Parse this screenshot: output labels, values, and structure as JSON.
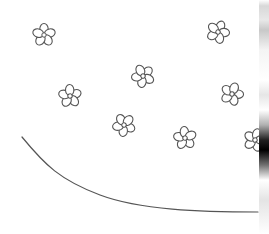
{
  "scene": {
    "description": "Hand-drawn pencil sketch of small five-petal flowers scattered on white paper with a curved line below",
    "background": "#ffffff",
    "stroke_color": "#555555",
    "flowers": [
      {
        "x": 44,
        "y": 35,
        "r": 11
      },
      {
        "x": 218,
        "y": 32,
        "r": 11
      },
      {
        "x": 143,
        "y": 76,
        "r": 11
      },
      {
        "x": 70,
        "y": 96,
        "r": 11
      },
      {
        "x": 232,
        "y": 94,
        "r": 11
      },
      {
        "x": 124,
        "y": 125,
        "r": 11
      },
      {
        "x": 185,
        "y": 138,
        "r": 11
      },
      {
        "x": 255,
        "y": 140,
        "r": 11
      }
    ],
    "curve": {
      "path": "M22 137 C 45 165, 60 180, 100 195 S 200 212, 258 212"
    }
  }
}
